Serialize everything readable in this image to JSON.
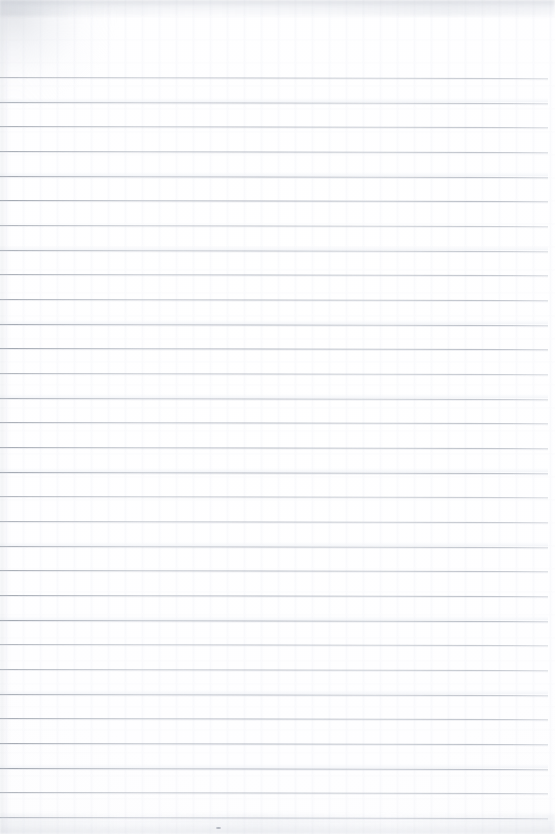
{
  "document": {
    "kind": "scanned-image",
    "subject": "blank ruled notepad page",
    "title": "Blank Ruled Notepad Page",
    "text_content": "",
    "handwriting_present": "no",
    "printed_text_present": "no",
    "page_width_px": 555,
    "page_height_px": 834,
    "background_color": "#ffffff",
    "paper_tint": "#fdfdfe"
  },
  "ruling": {
    "line_color": "#a6acb8",
    "line_color_light": "#c6cad2",
    "line_thickness_px": 1,
    "line_count": 31,
    "first_line_y": 77,
    "line_spacing_px": 24.67,
    "line_left_x": 0,
    "line_right_x": 548,
    "tilt_deg": 0.12,
    "margin_top_px": 77,
    "margin_bottom_px": 17,
    "y_positions": [
      77,
      101.7,
      126.3,
      151,
      175.7,
      200.3,
      225,
      249.7,
      274.3,
      299,
      323.7,
      348.3,
      373,
      397.7,
      422.3,
      447,
      471.7,
      496.3,
      521,
      545.7,
      570.3,
      595,
      619.7,
      644.3,
      669,
      693.7,
      718.3,
      743,
      767.7,
      792.3,
      817
    ]
  },
  "scan_artifacts": {
    "corner_smudge": {
      "position": "top-left",
      "color": "#c4c8d0",
      "opacity": 0.4
    },
    "top_edge_shadow": {
      "color": "#babec7",
      "height_px": 16
    },
    "left_edge_shadow": {
      "color": "#c8ccd4",
      "width_px": 12
    },
    "bottom_edge_shadow": {
      "color": "#cdd1d9",
      "height_px": 20
    },
    "speck": {
      "x": 216,
      "y": 827,
      "color": "#b0b5be"
    },
    "grain": "faint vertical scanner banding"
  }
}
